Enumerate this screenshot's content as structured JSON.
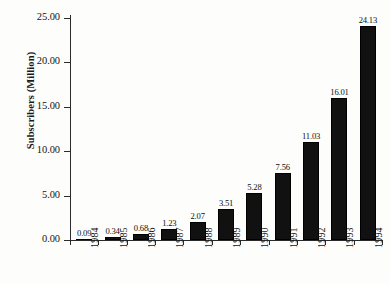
{
  "chart_data": {
    "type": "bar",
    "title": "",
    "xlabel": "",
    "ylabel": "Subscribers (Million)",
    "categories": [
      "1984",
      "1985",
      "1986",
      "1987",
      "1988",
      "1989",
      "1990",
      "1991",
      "1992",
      "1993",
      "1994"
    ],
    "values": [
      0.09,
      0.34,
      0.68,
      1.23,
      2.07,
      3.51,
      5.28,
      7.56,
      11.03,
      16.01,
      24.13
    ],
    "value_labels": [
      "0.09",
      "0.34",
      "0.68",
      "1.23",
      "2.07",
      "3.51",
      "5.28",
      "7.56",
      "11.03",
      "16.01",
      "24.13"
    ],
    "ylim": [
      0.0,
      25.0
    ],
    "ytick_values": [
      0.0,
      5.0,
      10.0,
      15.0,
      20.0,
      25.0
    ],
    "ytick_labels": [
      "0.00",
      "5.00",
      "10.00",
      "15.00",
      "20.00",
      "25.00"
    ],
    "grid": false,
    "legend": false,
    "bar_color": "#111111",
    "axis_color": "#2b2b2b"
  },
  "axes": {
    "y_title": "Subscribers (Million)"
  }
}
